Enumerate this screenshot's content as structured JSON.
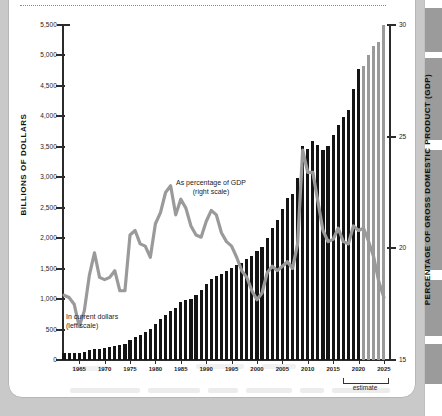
{
  "figure": {
    "left_axis_title": "BILLIONS OF DOLLARS",
    "right_axis_title": "PERCENTAGE OF GROSS DOMESTIC PRODUCT (GDP)",
    "annotation_gdp_line1": "As percentage of GDP",
    "annotation_gdp_line2": "(right scale)",
    "annotation_dollars_line1": "In current dollars",
    "annotation_dollars_line2": "(left scale)",
    "estimate_label": "estimate",
    "color_actual_bar": "#141414",
    "color_estimate_bar": "#9a9a9a",
    "color_line": "#9a9a9a",
    "color_axis": "#2b2b2b"
  },
  "chart_data": {
    "type": "bar",
    "title": "",
    "subtitle": "",
    "xlabel": "",
    "ylabel": "BILLIONS OF DOLLARS",
    "y2label": "PERCENTAGE OF GROSS DOMESTIC PRODUCT (GDP)",
    "grid": false,
    "legend_position": "inline-annotation",
    "ylim": [
      0,
      5500
    ],
    "y2lim": [
      15,
      30
    ],
    "yticks": [
      0,
      500,
      1000,
      1500,
      2000,
      2500,
      3000,
      3500,
      4000,
      4500,
      5000,
      5500
    ],
    "ytick_labels": [
      "0",
      "500",
      "1,000",
      "1,500",
      "2,000",
      "2,500",
      "3,000",
      "3,500",
      "4,000",
      "4,500",
      "5,000",
      "5,500"
    ],
    "y2ticks": [
      15,
      20,
      25,
      30
    ],
    "y2tick_labels": [
      "15",
      "20",
      "25",
      "30"
    ],
    "xlim": [
      1962,
      2026
    ],
    "xticks": [
      1965,
      1970,
      1975,
      1980,
      1985,
      1990,
      1995,
      2000,
      2005,
      2010,
      2015,
      2020,
      2025
    ],
    "xtick_labels": [
      "1965",
      "1970",
      "1975",
      "1980",
      "1985",
      "1990",
      "1995",
      "2000",
      "2005",
      "2010",
      "2015",
      "2020",
      "2025"
    ],
    "estimate_start_year": 2021,
    "x": [
      1962,
      1963,
      1964,
      1965,
      1966,
      1967,
      1968,
      1969,
      1970,
      1971,
      1972,
      1973,
      1974,
      1975,
      1976,
      1977,
      1978,
      1979,
      1980,
      1981,
      1982,
      1983,
      1984,
      1985,
      1986,
      1987,
      1988,
      1989,
      1990,
      1991,
      1992,
      1993,
      1994,
      1995,
      1996,
      1997,
      1998,
      1999,
      2000,
      2001,
      2002,
      2003,
      2004,
      2005,
      2006,
      2007,
      2008,
      2009,
      2010,
      2011,
      2012,
      2013,
      2014,
      2015,
      2016,
      2017,
      2018,
      2019,
      2020,
      2021,
      2022,
      2023,
      2024,
      2025
    ],
    "series": [
      {
        "name": "In current dollars (left scale)",
        "axis": "left",
        "units": "billions of dollars",
        "values": [
          107,
          111,
          119,
          118,
          135,
          157,
          178,
          184,
          196,
          210,
          231,
          246,
          269,
          332,
          372,
          409,
          459,
          504,
          591,
          678,
          746,
          808,
          852,
          946,
          990,
          1004,
          1064,
          1143,
          1253,
          1324,
          1382,
          1409,
          1462,
          1516,
          1561,
          1601,
          1653,
          1702,
          1789,
          1863,
          2011,
          2160,
          2293,
          2472,
          2655,
          2729,
          2983,
          3518,
          3457,
          3603,
          3537,
          3455,
          3506,
          3692,
          3853,
          3982,
          4109,
          4447,
          4779,
          4829,
          5000,
          5148,
          5215,
          5500
        ]
      },
      {
        "name": "As percentage of GDP (right scale)",
        "axis": "right",
        "units": "percent of GDP",
        "values": [
          17.9,
          17.8,
          17.5,
          16.5,
          17.2,
          18.8,
          19.8,
          18.7,
          18.6,
          18.7,
          19.0,
          18.1,
          18.1,
          20.6,
          20.8,
          20.2,
          20.1,
          19.6,
          21.1,
          21.6,
          22.5,
          22.8,
          21.5,
          22.2,
          21.8,
          21.0,
          20.6,
          20.5,
          21.2,
          21.7,
          21.5,
          20.7,
          20.3,
          20.1,
          19.6,
          19.0,
          18.7,
          18.1,
          17.7,
          18.0,
          18.9,
          19.2,
          19.0,
          19.2,
          19.4,
          19.1,
          20.2,
          24.4,
          23.4,
          23.4,
          22.1,
          20.8,
          20.3,
          20.4,
          20.9,
          20.3,
          20.2,
          21.0,
          20.8,
          20.9,
          20.3,
          19.6,
          18.5,
          17.8
        ]
      }
    ]
  }
}
